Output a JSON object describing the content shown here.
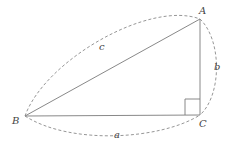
{
  "diagram": {
    "type": "right-triangle",
    "vertices": {
      "A": {
        "label": "A",
        "x": 200,
        "y": 19
      },
      "B": {
        "label": "B",
        "x": 25,
        "y": 116
      },
      "C": {
        "label": "C",
        "x": 200,
        "y": 115
      }
    },
    "sides": {
      "a": {
        "label": "a",
        "from": "B",
        "to": "C"
      },
      "b": {
        "label": "b",
        "from": "C",
        "to": "A"
      },
      "c": {
        "label": "c",
        "from": "B",
        "to": "A"
      }
    },
    "right_angle_at": "C",
    "colors": {
      "stroke": "#7a7a7a",
      "label": "#444444",
      "background": "#ffffff"
    }
  }
}
